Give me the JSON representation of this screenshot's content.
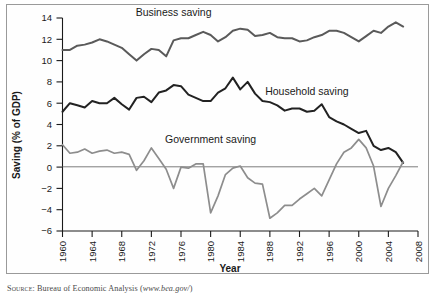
{
  "figure": {
    "source_prefix": "Source:",
    "source_text": "Bureau of Economic Analysis (",
    "source_url": "www.bea.gov/",
    "source_suffix": ")"
  },
  "chart_data": {
    "type": "line",
    "title": "",
    "xlabel": "Year",
    "ylabel": "Saving (% of GDP)",
    "xlim": [
      1960,
      2008
    ],
    "ylim": [
      -6,
      14
    ],
    "ytick_step": 2,
    "xtick_step": 4,
    "grid": false,
    "legend_position": "inline-annotations",
    "xticks": [
      1960,
      1964,
      1968,
      1972,
      1976,
      1980,
      1984,
      1988,
      1992,
      1996,
      2000,
      2004,
      2008
    ],
    "yticks": [
      -6,
      -4,
      -2,
      0,
      2,
      4,
      6,
      8,
      10,
      12,
      14
    ],
    "x": [
      1960,
      1961,
      1962,
      1963,
      1964,
      1965,
      1966,
      1967,
      1968,
      1969,
      1970,
      1971,
      1972,
      1973,
      1974,
      1975,
      1976,
      1977,
      1978,
      1979,
      1980,
      1981,
      1982,
      1983,
      1984,
      1985,
      1986,
      1987,
      1988,
      1989,
      1990,
      1991,
      1992,
      1993,
      1994,
      1995,
      1996,
      1997,
      1998,
      1999,
      2000,
      2001,
      2002,
      2003,
      2004,
      2005,
      2006
    ],
    "series": [
      {
        "name": "Business saving",
        "color": "#5a5a5a",
        "label_x": 1975,
        "label_y": 14.2,
        "values": [
          11.0,
          11.0,
          11.4,
          11.5,
          11.7,
          12.0,
          11.8,
          11.5,
          11.2,
          10.6,
          10.0,
          10.6,
          11.1,
          11.0,
          10.4,
          11.9,
          12.1,
          12.1,
          12.4,
          12.7,
          12.4,
          11.8,
          12.2,
          12.8,
          13.0,
          12.9,
          12.3,
          12.4,
          12.6,
          12.2,
          12.1,
          12.1,
          11.8,
          11.9,
          12.2,
          12.4,
          12.8,
          12.8,
          12.6,
          12.2,
          11.8,
          12.3,
          12.8,
          12.6,
          13.2,
          13.6,
          13.2
        ]
      },
      {
        "name": "Household saving",
        "color": "#222222",
        "label_x": 1993,
        "label_y": 6.8,
        "values": [
          5.2,
          6.0,
          5.8,
          5.6,
          6.2,
          6.0,
          6.0,
          6.5,
          5.9,
          5.4,
          6.5,
          6.6,
          6.1,
          7.0,
          7.2,
          7.7,
          7.6,
          6.8,
          6.5,
          6.2,
          6.2,
          7.0,
          7.4,
          8.4,
          7.3,
          8.0,
          6.9,
          6.2,
          6.1,
          5.8,
          5.3,
          5.5,
          5.5,
          5.2,
          5.3,
          5.9,
          4.7,
          4.3,
          4.0,
          3.6,
          3.2,
          3.4,
          2.0,
          1.6,
          1.8,
          1.4,
          0.4
        ]
      },
      {
        "name": "Government saving",
        "color": "#8d8d8d",
        "label_x": 1980,
        "label_y": 2.3,
        "values": [
          2.1,
          1.3,
          1.4,
          1.7,
          1.3,
          1.5,
          1.6,
          1.3,
          1.4,
          1.2,
          -0.3,
          0.6,
          1.8,
          0.8,
          -0.2,
          -2.0,
          0.0,
          -0.1,
          0.3,
          0.3,
          -4.3,
          -2.7,
          -0.7,
          -0.1,
          0.1,
          -1.0,
          -1.5,
          -1.6,
          -4.8,
          -4.3,
          -3.6,
          -3.6,
          -3.0,
          -2.5,
          -2.0,
          -2.7,
          -3.6,
          -4.7,
          -3.0,
          -2.1,
          -1.2,
          0.3,
          1.8,
          2.6,
          2.1,
          0.5,
          -1.9
        ]
      }
    ],
    "government_saving_tail": {
      "comment": "detailed 1998-2006 government path",
      "x": [
        1996,
        1997,
        1998,
        1999,
        2000,
        2001,
        2002,
        2003,
        2004,
        2005,
        2006
      ],
      "values": [
        -1.2,
        0.3,
        1.4,
        1.8,
        2.6,
        1.8,
        0.1,
        -3.7,
        -2.0,
        -0.8,
        0.5
      ]
    }
  }
}
